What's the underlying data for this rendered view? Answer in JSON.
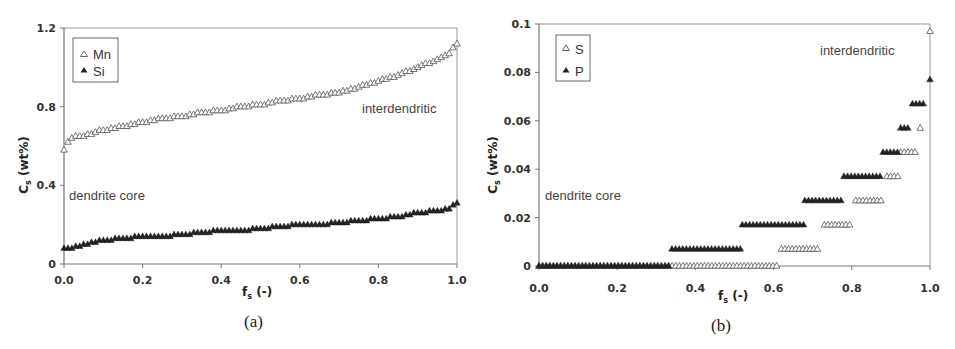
{
  "chart_data": [
    {
      "type": "scatter",
      "panel": "(a)",
      "xlabel": "f_s (-)",
      "ylabel": "C_s (wt%)",
      "xlim": [
        0,
        1.0
      ],
      "ylim": [
        0,
        1.2
      ],
      "xticks": [
        "0.0",
        "0.2",
        "0.4",
        "0.6",
        "0.8",
        "1.0"
      ],
      "yticks": [
        "0",
        "0.4",
        "0.8",
        "1.2"
      ],
      "grid": false,
      "legend_position": "upper-left",
      "annotations": [
        "dendrite core",
        "interdendritic"
      ],
      "series": [
        {
          "name": "Mn",
          "marker": "open-triangle",
          "x": [
            0.0,
            0.01,
            0.03,
            0.05,
            0.08,
            0.1,
            0.15,
            0.2,
            0.25,
            0.3,
            0.35,
            0.4,
            0.45,
            0.5,
            0.55,
            0.6,
            0.65,
            0.7,
            0.75,
            0.8,
            0.85,
            0.9,
            0.95,
            0.98,
            1.0
          ],
          "values": [
            0.58,
            0.62,
            0.65,
            0.65,
            0.67,
            0.68,
            0.7,
            0.72,
            0.74,
            0.75,
            0.77,
            0.78,
            0.8,
            0.81,
            0.83,
            0.84,
            0.86,
            0.87,
            0.9,
            0.93,
            0.96,
            1.0,
            1.04,
            1.07,
            1.12
          ]
        },
        {
          "name": "Si",
          "marker": "filled-triangle",
          "x": [
            0.0,
            0.02,
            0.05,
            0.08,
            0.1,
            0.15,
            0.2,
            0.25,
            0.3,
            0.35,
            0.4,
            0.45,
            0.5,
            0.55,
            0.6,
            0.65,
            0.7,
            0.75,
            0.8,
            0.85,
            0.9,
            0.95,
            0.98,
            1.0
          ],
          "values": [
            0.08,
            0.08,
            0.1,
            0.11,
            0.12,
            0.13,
            0.14,
            0.14,
            0.15,
            0.16,
            0.17,
            0.17,
            0.18,
            0.19,
            0.2,
            0.2,
            0.21,
            0.22,
            0.23,
            0.24,
            0.26,
            0.27,
            0.28,
            0.31
          ]
        }
      ]
    },
    {
      "type": "scatter",
      "panel": "(b)",
      "xlabel": "f_s (-)",
      "ylabel": "C_s (wt%)",
      "xlim": [
        0,
        1.0
      ],
      "ylim": [
        0,
        0.1
      ],
      "xticks": [
        "0.0",
        "0.2",
        "0.4",
        "0.6",
        "0.8",
        "1.0"
      ],
      "yticks": [
        "0",
        "0.02",
        "0.04",
        "0.06",
        "0.08",
        "0.1"
      ],
      "grid": false,
      "legend_position": "upper-left",
      "annotations": [
        "dendrite core",
        "interdendritic"
      ],
      "series": [
        {
          "name": "S",
          "marker": "open-triangle",
          "segments": [
            {
              "x_start": 0.0,
              "x_end": 0.61,
              "value": 0.0
            },
            {
              "x_start": 0.62,
              "x_end": 0.72,
              "value": 0.007
            },
            {
              "x_start": 0.73,
              "x_end": 0.8,
              "value": 0.017
            },
            {
              "x_start": 0.81,
              "x_end": 0.88,
              "value": 0.027
            },
            {
              "x_start": 0.89,
              "x_end": 0.92,
              "value": 0.037
            },
            {
              "x_start": 0.925,
              "x_end": 0.97,
              "value": 0.047
            },
            {
              "x_start": 0.975,
              "x_end": 0.975,
              "value": 0.057
            },
            {
              "x_start": 1.0,
              "x_end": 1.0,
              "value": 0.097
            }
          ]
        },
        {
          "name": "P",
          "marker": "filled-triangle",
          "segments": [
            {
              "x_start": 0.0,
              "x_end": 0.34,
              "value": 0.0
            },
            {
              "x_start": 0.34,
              "x_end": 0.52,
              "value": 0.007
            },
            {
              "x_start": 0.52,
              "x_end": 0.68,
              "value": 0.017
            },
            {
              "x_start": 0.68,
              "x_end": 0.78,
              "value": 0.027
            },
            {
              "x_start": 0.78,
              "x_end": 0.88,
              "value": 0.037
            },
            {
              "x_start": 0.88,
              "x_end": 0.92,
              "value": 0.047
            },
            {
              "x_start": 0.925,
              "x_end": 0.95,
              "value": 0.057
            },
            {
              "x_start": 0.955,
              "x_end": 0.99,
              "value": 0.067
            },
            {
              "x_start": 1.0,
              "x_end": 1.0,
              "value": 0.077
            }
          ]
        }
      ]
    }
  ],
  "panel_a": {
    "caption": "(a)",
    "ylabel_main": "C",
    "ylabel_sub": "s",
    "ylabel_rest": " (wt%)",
    "xlabel_main": "f",
    "xlabel_sub": "s",
    "xlabel_rest": " (-)",
    "legend": [
      "Mn",
      "Si"
    ],
    "annotation_core": "dendrite core",
    "annotation_inter": "interdendritic"
  },
  "panel_b": {
    "caption": "(b)",
    "ylabel_main": "C",
    "ylabel_sub": "s",
    "ylabel_rest": " (wt%)",
    "xlabel_main": "f",
    "xlabel_sub": "s",
    "xlabel_rest": " (-)",
    "legend": [
      "S",
      "P"
    ],
    "annotation_core": "dendrite core",
    "annotation_inter": "interdendritic"
  },
  "colors": {
    "axis": "#777777",
    "marker": "#333333",
    "text": "#333333"
  }
}
